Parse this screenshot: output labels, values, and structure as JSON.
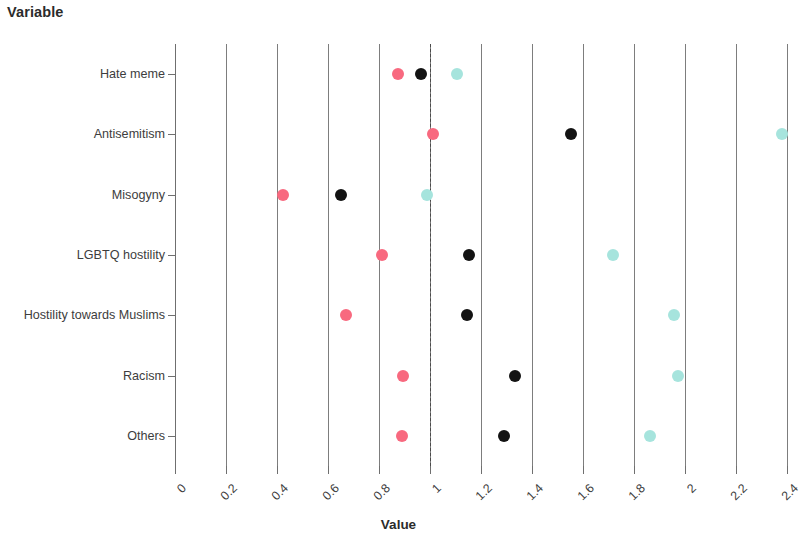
{
  "heading": "Variable",
  "axis": {
    "x_title": "Value",
    "x_ticks": [
      "0",
      "0.2",
      "0.4",
      "0.6",
      "0.8",
      "1",
      "1.2",
      "1.4",
      "1.6",
      "1.8",
      "2",
      "2.2",
      "2.4"
    ],
    "x_tick_values": [
      0,
      0.2,
      0.4,
      0.6,
      0.8,
      1,
      1.2,
      1.4,
      1.6,
      1.8,
      2,
      2.2,
      2.4
    ],
    "reference_line": 1
  },
  "colors": {
    "pink": "#f8697f",
    "black": "#131313",
    "cyan": "#a6e4dd",
    "gridline": "#7d7d7d",
    "text": "#3d3d3d"
  },
  "chart_data": {
    "type": "scatter",
    "title": "Variable",
    "xlabel": "Value",
    "ylabel": "Variable",
    "xlim": [
      0,
      2.4
    ],
    "grid": true,
    "legend_position": "none",
    "annotations": [
      "dashed vertical reference line at Value = 1"
    ],
    "categories": [
      "Hate meme",
      "Antisemitism",
      "Misogyny",
      "LGBTQ hostility",
      "Hostility towards Muslims",
      "Racism",
      "Others"
    ],
    "series": [
      {
        "name": "pink",
        "color": "#f8697f",
        "values": [
          0.875,
          1.01,
          0.424,
          0.812,
          0.671,
          0.894,
          0.89
        ]
      },
      {
        "name": "black",
        "color": "#131313",
        "values": [
          0.965,
          1.553,
          0.651,
          1.153,
          1.145,
          1.333,
          1.29
        ]
      },
      {
        "name": "cyan",
        "color": "#a6e4dd",
        "values": [
          1.106,
          2.38,
          0.988,
          1.718,
          1.957,
          1.973,
          1.863
        ]
      }
    ]
  }
}
